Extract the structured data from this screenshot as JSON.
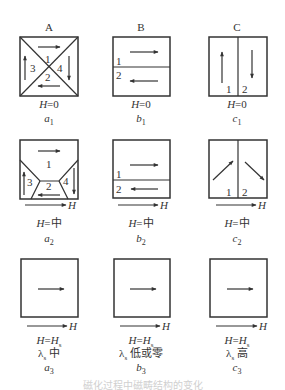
{
  "columns": [
    {
      "id": "A",
      "label": "A"
    },
    {
      "id": "B",
      "label": "B"
    },
    {
      "id": "C",
      "label": "C"
    }
  ],
  "rows": [
    {
      "field_label": "H=0",
      "panels": [
        {
          "id": "a1",
          "caption_italic": "a",
          "caption_sub": "1",
          "field": "H=0",
          "domains": [
            "1",
            "2",
            "3",
            "4"
          ]
        },
        {
          "id": "b1",
          "caption_italic": "b",
          "caption_sub": "1",
          "field": "H=0",
          "domains": [
            "1",
            "2"
          ]
        },
        {
          "id": "c1",
          "caption_italic": "c",
          "caption_sub": "1",
          "field": "H=0",
          "domains": [
            "1",
            "2"
          ]
        }
      ]
    },
    {
      "field_label": "H=中",
      "panels": [
        {
          "id": "a2",
          "caption_italic": "a",
          "caption_sub": "2",
          "field": "H=中",
          "domains": [
            "1",
            "2",
            "3",
            "4"
          ]
        },
        {
          "id": "b2",
          "caption_italic": "b",
          "caption_sub": "2",
          "field": "H=中",
          "domains": [
            "1",
            "2"
          ]
        },
        {
          "id": "c2",
          "caption_italic": "c",
          "caption_sub": "2",
          "field": "H=中",
          "domains": [
            "1",
            "2"
          ]
        }
      ]
    },
    {
      "field_label": "H=Hs",
      "panels": [
        {
          "id": "a3",
          "caption_italic": "a",
          "caption_sub": "3",
          "field": "H=H",
          "field_sub": "s",
          "lambda": "λ",
          "lambda_sub": "s",
          "lambda_value": "中"
        },
        {
          "id": "b3",
          "caption_italic": "b",
          "caption_sub": "3",
          "field": "H=H",
          "field_sub": "s",
          "lambda": "λ",
          "lambda_sub": "s",
          "lambda_value": "低或零"
        },
        {
          "id": "c3",
          "caption_italic": "c",
          "caption_sub": "3",
          "field": "H=H",
          "field_sub": "s",
          "lambda": "λ",
          "lambda_sub": "s",
          "lambda_value": "高"
        }
      ]
    }
  ],
  "field_arrow_label": "H",
  "caption": "磁化过程中磁畴结构的变化",
  "colors": {
    "line": "#333333",
    "text": "#333333"
  }
}
